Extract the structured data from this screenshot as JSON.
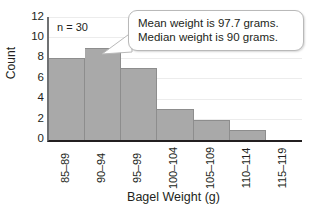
{
  "chart_data": {
    "type": "bar",
    "title": "",
    "xlabel": "Bagel Weight (g)",
    "ylabel": "Count",
    "categories": [
      "85–89",
      "90–94",
      "95–99",
      "100–104",
      "105–109",
      "110–114",
      "115–119"
    ],
    "values": [
      8,
      9,
      7,
      3,
      2,
      1,
      0
    ],
    "ylim": [
      0,
      12
    ],
    "ytick_values": [
      0,
      2,
      4,
      6,
      8,
      10,
      12
    ],
    "ytick_labels": [
      "0",
      "2",
      "4",
      "6",
      "8",
      "10",
      "12"
    ],
    "grid": true,
    "legend": "none",
    "bar_color": "#a9a9a9",
    "annotations": {
      "sample_size": "n = 30",
      "callout_lines": [
        "Mean weight is 97.7 grams.",
        "Median weight is 90 grams."
      ]
    }
  }
}
